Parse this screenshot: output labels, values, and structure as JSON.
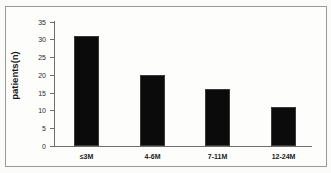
{
  "chart_data": {
    "type": "bar",
    "title": "",
    "xlabel": "",
    "ylabel": "patients(n)",
    "categories": [
      "≤3M",
      "4-6M",
      "7-11M",
      "12-24M"
    ],
    "values": [
      31,
      20,
      16,
      11
    ],
    "ylim": [
      0,
      35
    ],
    "yticks": [
      0,
      5,
      10,
      15,
      20,
      25,
      30,
      35
    ],
    "ytick_labels": [
      "0",
      "5",
      "10",
      "15",
      "20",
      "25",
      "30",
      "35"
    ],
    "grid": false,
    "legend": null,
    "bar_color": "#0b0b0b",
    "axis_color": "#6e6e6e",
    "background_color": "#fdfdfc"
  }
}
